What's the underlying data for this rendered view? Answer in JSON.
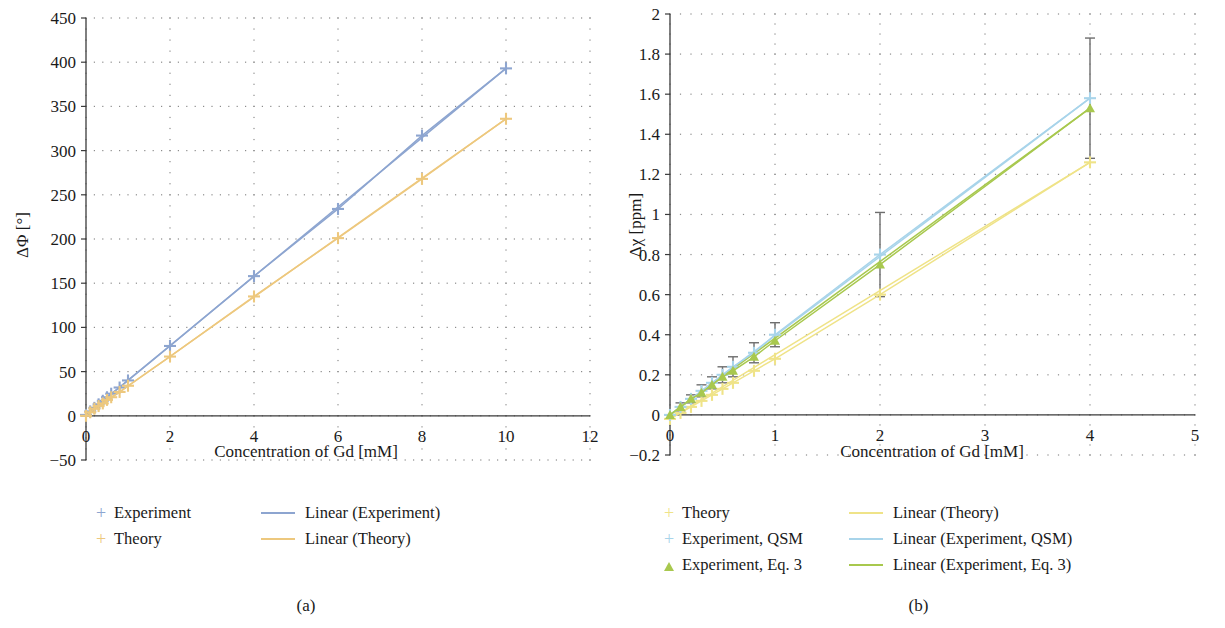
{
  "figure": {
    "panels": [
      {
        "caption": "(a)",
        "xlabel": "Concentration of Gd [mM]",
        "ylabel": "ΔΦ [°]"
      },
      {
        "caption": "(b)",
        "xlabel": "Concentration of Gd [mM]",
        "ylabel": "Δχ [ppm]"
      }
    ]
  },
  "colors": {
    "blue": "#8da5d0",
    "orange": "#edc87e",
    "yellow": "#efe388",
    "lightblue": "#a8d4ea",
    "green": "#a8c84e",
    "errorbar": "#6e6e6e",
    "axis": "#3b3b3b",
    "grid": "#8c8c8c"
  },
  "legend_a": {
    "left": [
      {
        "marker": "plus",
        "color_key": "blue",
        "label": "Experiment"
      },
      {
        "marker": "plus",
        "color_key": "orange",
        "label": "Theory"
      }
    ],
    "right": [
      {
        "marker": "line",
        "color_key": "blue",
        "label": "Linear (Experiment)"
      },
      {
        "marker": "line",
        "color_key": "orange",
        "label": "Linear (Theory)"
      }
    ]
  },
  "legend_b": {
    "left": [
      {
        "marker": "plus",
        "color_key": "yellow",
        "label": "Theory"
      },
      {
        "marker": "plus",
        "color_key": "lightblue",
        "label": "Experiment, QSM"
      },
      {
        "marker": "triangle",
        "color_key": "green",
        "label": "Experiment, Eq. 3"
      }
    ],
    "right": [
      {
        "marker": "line",
        "color_key": "yellow",
        "label": "Linear (Theory)"
      },
      {
        "marker": "line",
        "color_key": "lightblue",
        "label": "Linear (Experiment, QSM)"
      },
      {
        "marker": "line",
        "color_key": "green",
        "label": "Linear (Experiment, Eq. 3)"
      }
    ]
  },
  "chart_data": [
    {
      "type": "scatter",
      "panel": "(a)",
      "title": "",
      "xlabel": "Concentration of Gd [mM]",
      "ylabel": "ΔΦ [°]",
      "xlim": [
        0,
        12
      ],
      "ylim": [
        -50,
        450
      ],
      "xticks": [
        0,
        2,
        4,
        6,
        8,
        10,
        12
      ],
      "yticks": [
        -50,
        0,
        50,
        100,
        150,
        200,
        250,
        300,
        350,
        400,
        450
      ],
      "xtick_labels": [
        "0",
        "2",
        "4",
        "6",
        "8",
        "10",
        "12"
      ],
      "ytick_labels": [
        "-50",
        "0",
        "50",
        "100",
        "150",
        "200",
        "250",
        "300",
        "350",
        "400",
        "450"
      ],
      "grid": "dotted",
      "legend_position": "below",
      "series": [
        {
          "name": "Experiment",
          "marker": "plus",
          "color": "#8da5d0",
          "x": [
            0,
            0.1,
            0.2,
            0.3,
            0.4,
            0.5,
            0.6,
            0.8,
            1.0,
            2.0,
            4.0,
            6.0,
            8.0,
            10.0
          ],
          "y": [
            1,
            5,
            9,
            13,
            17,
            21,
            25,
            32,
            40,
            79,
            158,
            234,
            317,
            393
          ]
        },
        {
          "name": "Theory",
          "marker": "plus",
          "color": "#edc87e",
          "x": [
            0,
            0.1,
            0.2,
            0.3,
            0.4,
            0.5,
            0.6,
            0.8,
            1.0,
            2.0,
            4.0,
            6.0,
            8.0,
            10.0
          ],
          "y": [
            0,
            4,
            8,
            11,
            14,
            18,
            21,
            27,
            34,
            67,
            135,
            201,
            268,
            336
          ]
        },
        {
          "name": "Linear (Experiment)",
          "type": "fit-line",
          "color": "#8da5d0",
          "x": [
            0,
            10.0
          ],
          "y": [
            1,
            393
          ]
        },
        {
          "name": "Linear (Theory)",
          "type": "fit-line",
          "color": "#edc87e",
          "x": [
            0,
            10.0
          ],
          "y": [
            0,
            336
          ]
        }
      ]
    },
    {
      "type": "scatter",
      "panel": "(b)",
      "title": "",
      "xlabel": "Concentration of Gd [mM]",
      "ylabel": "Δχ [ppm]",
      "xlim": [
        0,
        5
      ],
      "ylim": [
        -0.2,
        2
      ],
      "xticks": [
        0,
        1,
        2,
        3,
        4,
        5
      ],
      "yticks": [
        -0.2,
        0,
        0.2,
        0.4,
        0.6,
        0.8,
        1.0,
        1.2,
        1.4,
        1.6,
        1.8,
        2.0
      ],
      "xtick_labels": [
        "0",
        "1",
        "2",
        "3",
        "4",
        "5"
      ],
      "ytick_labels": [
        "-0.2",
        "0",
        "0.2",
        "0.4",
        "0.6",
        "0.8",
        "1",
        "1.2",
        "1.4",
        "1.6",
        "1.8",
        "2"
      ],
      "grid": "dotted",
      "legend_position": "below",
      "series": [
        {
          "name": "Theory",
          "marker": "plus",
          "color": "#efe388",
          "x": [
            0,
            0.1,
            0.2,
            0.3,
            0.4,
            0.5,
            0.6,
            0.8,
            1.0,
            2.0,
            4.0
          ],
          "y": [
            -0.02,
            0.01,
            0.04,
            0.07,
            0.1,
            0.13,
            0.16,
            0.22,
            0.28,
            0.6,
            1.26
          ]
        },
        {
          "name": "Experiment, QSM",
          "marker": "plus",
          "color": "#a8d4ea",
          "x": [
            0,
            0.1,
            0.2,
            0.3,
            0.4,
            0.5,
            0.6,
            0.8,
            1.0,
            2.0,
            4.0
          ],
          "y": [
            0.0,
            0.04,
            0.08,
            0.12,
            0.16,
            0.2,
            0.24,
            0.31,
            0.4,
            0.8,
            1.58
          ],
          "yerr": [
            0.0,
            0.02,
            0.02,
            0.03,
            0.03,
            0.04,
            0.05,
            0.05,
            0.06,
            0.21,
            0.3
          ]
        },
        {
          "name": "Experiment, Eq. 3",
          "marker": "triangle",
          "color": "#a8c84e",
          "x": [
            0,
            0.1,
            0.2,
            0.3,
            0.4,
            0.5,
            0.6,
            0.8,
            1.0,
            2.0,
            4.0
          ],
          "y": [
            0.0,
            0.04,
            0.08,
            0.11,
            0.15,
            0.19,
            0.22,
            0.29,
            0.37,
            0.75,
            1.53
          ]
        },
        {
          "name": "Linear (Theory)",
          "type": "fit-line",
          "color": "#efe388",
          "x": [
            0,
            4.0
          ],
          "y": [
            -0.02,
            1.26
          ]
        },
        {
          "name": "Linear (Experiment, QSM)",
          "type": "fit-line",
          "color": "#a8d4ea",
          "x": [
            0,
            4.0
          ],
          "y": [
            0.0,
            1.58
          ]
        },
        {
          "name": "Linear (Experiment, Eq. 3)",
          "type": "fit-line",
          "color": "#a8c84e",
          "x": [
            0,
            4.0
          ],
          "y": [
            0.0,
            1.53
          ]
        }
      ]
    }
  ]
}
